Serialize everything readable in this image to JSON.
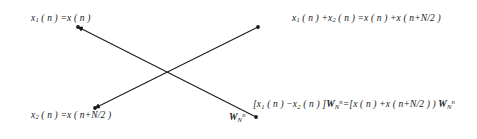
{
  "diagram": {
    "type": "fft-butterfly-signal-flow-graph",
    "background_color": "#ffffff",
    "line_color": "#1a1a1a",
    "text_color": "#1a1a1a",
    "nodes": [
      {
        "name": "input-top",
        "x": 78,
        "y": 27,
        "label": "x1(n)=x(n)"
      },
      {
        "name": "input-bottom",
        "x": 95,
        "y": 108,
        "label": "x2(n)=x(n+N/2)"
      },
      {
        "name": "output-top",
        "x": 258,
        "y": 27,
        "label": "x1(n)+x2(n)=x(n)+x(n+N/2)"
      },
      {
        "name": "output-bottom",
        "x": 256,
        "y": 117,
        "label": "[x1(n)-x2(n)]WNn"
      }
    ],
    "edges": [
      {
        "name": "edge-top-left-to-bottom-right",
        "from": [
          78,
          27
        ],
        "to": [
          256,
          117
        ],
        "arrow_at": "start"
      },
      {
        "name": "edge-bottom-left-to-top-right",
        "from": [
          95,
          108
        ],
        "to": [
          258,
          27
        ],
        "arrow_at": "start"
      }
    ],
    "labels": {
      "input_top": {
        "base": "x",
        "sub": "1",
        "rest": " ( n ) =x ( n )"
      },
      "output_top": {
        "seg1_base": "x",
        "seg1_sub": "1",
        "seg1_rest": " ( n ) +x",
        "seg2_sub": "2",
        "seg2_rest": " ( n ) =x ( n ) +x ( n+N/2 )"
      },
      "input_bottom": {
        "base": "x",
        "sub": "2",
        "rest": " ( n ) =x ( n+N/2 )"
      },
      "output_bottom": {
        "seg1": "[x",
        "seg1_sub": "1",
        "seg2": " ( n ) −x",
        "seg2_sub": "2",
        "seg3": " ( n ) ]",
        "w1": "W",
        "w1_sub": "N",
        "w1_sup": "n",
        "seg4": "=[x ( n ) +x ( n+N/2 ) ) ",
        "w2": "W",
        "w2_sub": "N",
        "w2_sup": "n"
      },
      "twiddle": {
        "base": "W",
        "sub": "N",
        "sup": "n"
      }
    }
  }
}
